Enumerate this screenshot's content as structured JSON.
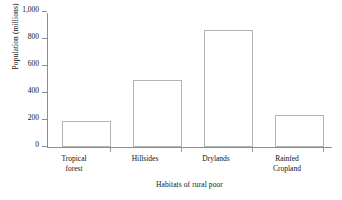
{
  "chart_data": {
    "type": "bar",
    "title": "",
    "subtitle": "",
    "xlabel": "Habitats of rural poor",
    "ylabel": "Population (millions)",
    "categories": [
      "Tropical forest",
      "Hillsides",
      "Drylands",
      "Rainfed Cropland"
    ],
    "category_lines": [
      [
        "Tropical",
        "forest"
      ],
      [
        "Hillsides",
        ""
      ],
      [
        "Drylands",
        ""
      ],
      [
        "Rainfed",
        "Cropland"
      ]
    ],
    "values": [
      196,
      500,
      870,
      240
    ],
    "ylim": [
      0,
      1000
    ],
    "yticks": [
      0,
      200,
      400,
      600,
      800,
      1000
    ],
    "ytick_labels": [
      "0",
      "200",
      "400",
      "600",
      "800",
      "1,000"
    ],
    "grid": false,
    "legend": false,
    "bar_fill": "#ffffff",
    "bar_edge": "#b4b4b4",
    "axis_color": "#8d8d8d",
    "background": "#ffffff"
  }
}
